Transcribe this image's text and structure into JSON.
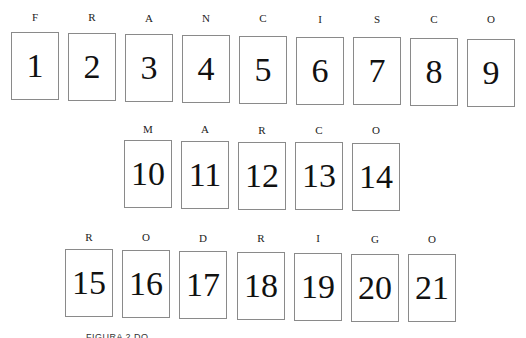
{
  "rows": [
    {
      "name": "FRANCISCO",
      "cells": [
        {
          "letter": "F",
          "number": "1"
        },
        {
          "letter": "R",
          "number": "2"
        },
        {
          "letter": "A",
          "number": "3"
        },
        {
          "letter": "N",
          "number": "4"
        },
        {
          "letter": "C",
          "number": "5"
        },
        {
          "letter": "I",
          "number": "6"
        },
        {
          "letter": "S",
          "number": "7"
        },
        {
          "letter": "C",
          "number": "8"
        },
        {
          "letter": "O",
          "number": "9"
        }
      ]
    },
    {
      "name": "MARCO",
      "cells": [
        {
          "letter": "M",
          "number": "10"
        },
        {
          "letter": "A",
          "number": "11"
        },
        {
          "letter": "R",
          "number": "12"
        },
        {
          "letter": "C",
          "number": "13"
        },
        {
          "letter": "O",
          "number": "14"
        }
      ]
    },
    {
      "name": "RODRIGO",
      "cells": [
        {
          "letter": "R",
          "number": "15"
        },
        {
          "letter": "O",
          "number": "16"
        },
        {
          "letter": "D",
          "number": "17"
        },
        {
          "letter": "R",
          "number": "18"
        },
        {
          "letter": "I",
          "number": "19"
        },
        {
          "letter": "G",
          "number": "20"
        },
        {
          "letter": "O",
          "number": "21"
        }
      ]
    }
  ],
  "caption": "FIGURA 2 DO RACIOCÍNIO"
}
